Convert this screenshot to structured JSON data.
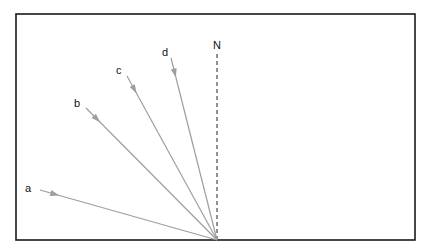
{
  "diagram": {
    "type": "ray-direction-diagram",
    "frame": {
      "x": 16,
      "y": 14,
      "width": 399,
      "height": 226,
      "stroke": "#1a1a1a"
    },
    "origin": {
      "x": 217,
      "y": 240
    },
    "north": {
      "label": "N",
      "label_pos": {
        "x": 213,
        "y": 49
      },
      "line_start": {
        "x": 217,
        "y": 54
      },
      "line_end": {
        "x": 217,
        "y": 240
      }
    },
    "ray_color": "#9e9e9e",
    "rays": [
      {
        "label": "a",
        "label_pos": {
          "x": 25,
          "y": 192
        },
        "start": {
          "x": 40,
          "y": 190
        }
      },
      {
        "label": "b",
        "label_pos": {
          "x": 74,
          "y": 107
        },
        "start": {
          "x": 86,
          "y": 108
        }
      },
      {
        "label": "c",
        "label_pos": {
          "x": 116,
          "y": 74
        },
        "start": {
          "x": 127,
          "y": 76
        }
      },
      {
        "label": "d",
        "label_pos": {
          "x": 162,
          "y": 56
        },
        "start": {
          "x": 171,
          "y": 58
        }
      }
    ]
  }
}
